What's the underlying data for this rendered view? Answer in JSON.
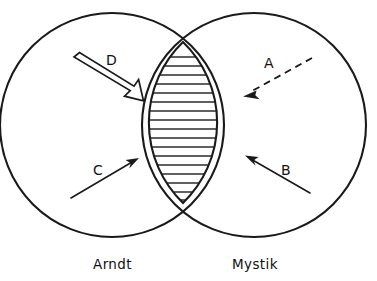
{
  "figure": {
    "type": "venn-diagram",
    "background_color": "#ffffff",
    "line_color": "#1a1a1a",
    "top_cropped_artifact": "",
    "sets": [
      {
        "id": "left",
        "label": "Arndt",
        "center_x": 112,
        "center_y": 125,
        "radius": 112
      },
      {
        "id": "right",
        "label": "Mystik",
        "center_x": 254,
        "center_y": 125,
        "radius": 112
      }
    ],
    "intersection": {
      "name": "hatched-lens",
      "fill_pattern": "horizontal-hatching",
      "hatch_line_count": 17,
      "hatch_spacing_px": 9,
      "top_y": 42,
      "bottom_y": 203
    },
    "annotations": [
      {
        "id": "A",
        "label": "A",
        "style": "dashed",
        "points_to": "right-circle-only",
        "label_x": 264,
        "label_y": 56,
        "x1": 312,
        "y1": 58,
        "x2": 245,
        "y2": 95
      },
      {
        "id": "B",
        "label": "B",
        "style": "solid-thin",
        "points_to": "intersection-from-right",
        "label_x": 281,
        "label_y": 163,
        "x1": 310,
        "y1": 193,
        "x2": 246,
        "y2": 156
      },
      {
        "id": "C",
        "label": "C",
        "style": "solid-thin",
        "points_to": "intersection-from-left",
        "label_x": 93,
        "label_y": 163,
        "x1": 71,
        "y1": 198,
        "x2": 138,
        "y2": 159
      },
      {
        "id": "D",
        "label": "D",
        "style": "open-outline",
        "points_to": "intersection-from-upper-left",
        "label_x": 106,
        "label_y": 53,
        "x1": 74,
        "y1": 58,
        "x2": 141,
        "y2": 99
      }
    ]
  }
}
